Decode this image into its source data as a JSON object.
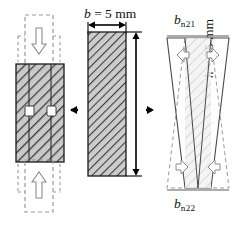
{
  "figure": {
    "background": "#ffffff",
    "width": 241,
    "height": 226
  },
  "colors": {
    "hatch_line": "#3d3d3d",
    "hatch_fill": "#c9c9c9",
    "outline": "#1a1a1a",
    "dashed": "#9a9a9a",
    "arrow_solid": "#000000",
    "arrow_hollow_stroke": "#8c8c8c",
    "arrow_hollow_fill": "#ffffff",
    "marker_fill": "#ffffff",
    "text": "#111111",
    "light_hatch": "#d8d8d8"
  },
  "panels": {
    "grip": {
      "name": "specimen-in-grips",
      "specimen_label": "hatched-specimen",
      "top_grip_label": "upper-grip",
      "bottom_grip_label": "lower-grip",
      "load_arrow_top": "downward-load-arrow",
      "load_arrow_bottom": "upward-load-arrow",
      "markers": [
        "measurement-marker-left",
        "measurement-marker-right"
      ]
    },
    "dimension": {
      "name": "dimensioned-cross-section",
      "width_label": "b = 5 mm",
      "width_symbol": "b",
      "width_value": "= 5 mm",
      "height_label": "h = 35 mm",
      "height_symbol": "h",
      "height_value": "= 35 mm",
      "width_mm": 5,
      "height_mm": 35
    },
    "deformed": {
      "name": "deformed-bowtie-shape",
      "top_symbol": "b",
      "top_subscript": "n21",
      "bottom_symbol": "b",
      "bottom_subscript": "n22",
      "top_label": "bn21",
      "bottom_label": "bn22",
      "arrows": [
        "top-left-expansion-arrow",
        "top-right-expansion-arrow",
        "bottom-left-contraction-arrow",
        "bottom-right-contraction-arrow"
      ]
    }
  },
  "connectors": {
    "left_arrow": "left-pointing-arrow",
    "right_arrow": "right-pointing-arrow"
  }
}
